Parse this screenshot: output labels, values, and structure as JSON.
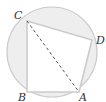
{
  "diagram": {
    "type": "geometry",
    "circle": {
      "cx": 52,
      "cy": 52,
      "r": 45
    },
    "points": {
      "A": {
        "label": "A",
        "x": 79,
        "y": 92
      },
      "B": {
        "label": "B",
        "x": 27,
        "y": 92
      },
      "C": {
        "label": "C",
        "x": 27,
        "y": 21
      },
      "D": {
        "label": "D",
        "x": 92,
        "y": 40
      }
    },
    "polygon_order": [
      "A",
      "B",
      "C",
      "D"
    ],
    "dashed_segments": [
      [
        "C",
        "A"
      ]
    ],
    "colors": {
      "segment_fill": "#eeeeee",
      "stroke": "#cccccc",
      "dashed": "#444444",
      "label": "#333333"
    }
  }
}
